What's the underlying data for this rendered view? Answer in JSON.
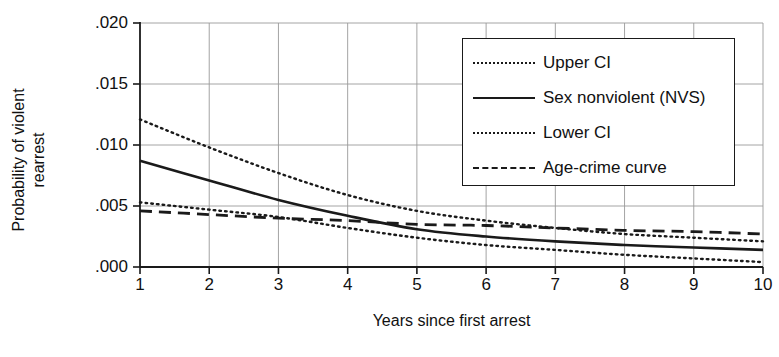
{
  "chart_data": {
    "type": "line",
    "title": "",
    "xlabel": "Years since first arrest",
    "ylabel": "Probability of violent rearrest",
    "xlim": [
      1,
      10
    ],
    "ylim": [
      0.0,
      0.02
    ],
    "xticks": [
      "1",
      "2",
      "3",
      "4",
      "5",
      "6",
      "7",
      "8",
      "9",
      "10"
    ],
    "yticks": [
      ".020",
      ".015",
      ".010",
      ".005",
      ".000"
    ],
    "ytick_values": [
      0.02,
      0.015,
      0.01,
      0.005,
      0.0
    ],
    "grid": true,
    "legend_position": "upper right",
    "x": [
      1,
      2,
      3,
      4,
      5,
      6,
      7,
      8,
      9,
      10
    ],
    "series": [
      {
        "name": "Upper CI",
        "style": "dotted",
        "color": "#1a1a1a",
        "values": [
          0.0121,
          0.0098,
          0.0077,
          0.0059,
          0.0046,
          0.0038,
          0.0032,
          0.0027,
          0.0024,
          0.0021
        ]
      },
      {
        "name": "Sex nonviolent (NVS)",
        "style": "solid",
        "color": "#1a1a1a",
        "values": [
          0.0087,
          0.0071,
          0.0055,
          0.0042,
          0.0031,
          0.0025,
          0.0021,
          0.0018,
          0.0016,
          0.0014
        ]
      },
      {
        "name": "Lower CI",
        "style": "dotted",
        "color": "#1a1a1a",
        "values": [
          0.0053,
          0.0047,
          0.0041,
          0.0032,
          0.0024,
          0.0018,
          0.0014,
          0.001,
          0.0007,
          0.0004
        ]
      },
      {
        "name": "Age-crime curve",
        "style": "dashed",
        "color": "#1a1a1a",
        "values": [
          0.0046,
          0.0043,
          0.004,
          0.0038,
          0.0035,
          0.0034,
          0.0032,
          0.003,
          0.0029,
          0.0027
        ]
      }
    ]
  },
  "axes": {
    "ylabel_line1": "Probability of violent",
    "ylabel_line2": "rearrest",
    "xlabel": "Years since first arrest"
  },
  "legend": {
    "items": [
      {
        "label": "Upper CI",
        "key": "dotted-line-key"
      },
      {
        "label": "Sex nonviolent (NVS)",
        "key": "solid-line-key"
      },
      {
        "label": "Lower CI",
        "key": "dotted-line-key"
      },
      {
        "label": "Age-crime curve",
        "key": "dashed-line-key"
      }
    ]
  }
}
